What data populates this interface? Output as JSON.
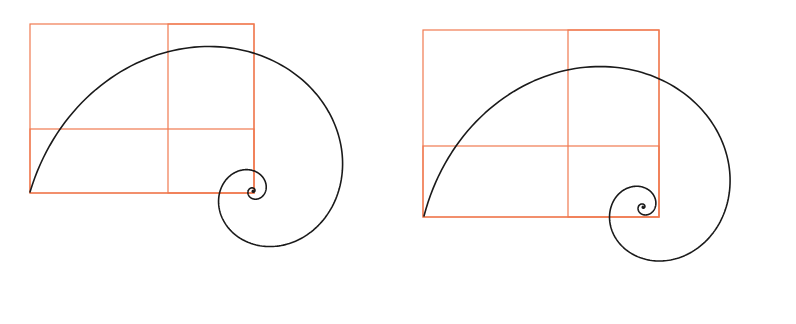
{
  "colors": {
    "background": "#ffffff",
    "guide": "#f07a50",
    "spiral": "#1a1a1a"
  },
  "figures": [
    {
      "id": "left",
      "rects": [
        {
          "x": 30,
          "y": 24,
          "w": 224,
          "h": 169
        },
        {
          "x": 168,
          "y": 24,
          "w": 86,
          "h": 169
        },
        {
          "x": 30,
          "y": 129,
          "w": 224,
          "h": 64
        }
      ],
      "spiral": {
        "cx": 253,
        "cy": 191,
        "start": {
          "x": 30,
          "y": 192
        },
        "turns": 4.6,
        "growth_per_quarter": 0.62,
        "aspect": 1.0
      }
    },
    {
      "id": "right",
      "rects": [
        {
          "x": 423,
          "y": 30,
          "w": 236,
          "h": 187
        },
        {
          "x": 568,
          "y": 30,
          "w": 91,
          "h": 187
        },
        {
          "x": 423,
          "y": 146,
          "w": 236,
          "h": 71
        }
      ],
      "spiral": {
        "cx": 643,
        "cy": 207,
        "start": {
          "x": 424,
          "y": 216
        },
        "turns": 4.6,
        "growth_per_quarter": 0.62,
        "aspect": 1.0
      }
    }
  ]
}
